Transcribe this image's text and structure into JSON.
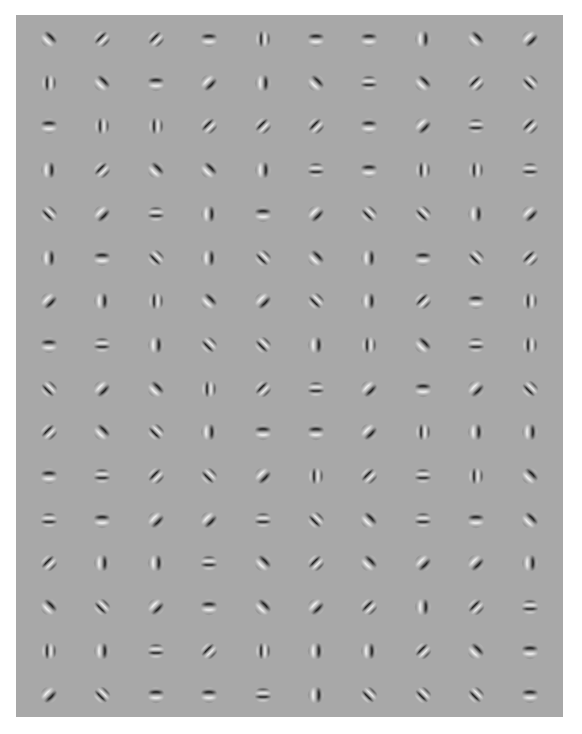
{
  "stimulus": {
    "description": "Grid of Gabor patches on gray background",
    "background_color": "#a8a8a8",
    "columns": 10,
    "rows": 16,
    "orientation_legend": {
      "=": 0,
      "|": 90,
      "/": 135,
      "\\": 45
    },
    "grid": [
      [
        "\\",
        "/",
        "/",
        "=",
        "|",
        "=",
        "=",
        "|",
        "\\",
        "/"
      ],
      [
        "|",
        "\\",
        "=",
        "/",
        "|",
        "\\",
        "=",
        "\\",
        "/",
        "\\"
      ],
      [
        "=",
        "|",
        "|",
        "/",
        "/",
        "/",
        "=",
        "/",
        "=",
        "/"
      ],
      [
        "|",
        "/",
        "\\",
        "\\",
        "|",
        "=",
        "=",
        "|",
        "|",
        "="
      ],
      [
        "\\",
        "/",
        "=",
        "|",
        "=",
        "/",
        "\\",
        "\\",
        "|",
        "/"
      ],
      [
        "|",
        "=",
        "\\",
        "|",
        "\\",
        "\\",
        "|",
        "=",
        "\\",
        "/"
      ],
      [
        "/",
        "|",
        "|",
        "\\",
        "/",
        "\\",
        "|",
        "/",
        "=",
        "|"
      ],
      [
        "=",
        "=",
        "|",
        "\\",
        "\\",
        "|",
        "|",
        "\\",
        "=",
        "|"
      ],
      [
        "\\",
        "/",
        "\\",
        "|",
        "/",
        "=",
        "/",
        "=",
        "/",
        "\\"
      ],
      [
        "/",
        "\\",
        "\\",
        "|",
        "=",
        "=",
        "/",
        "|",
        "|",
        "|"
      ],
      [
        "=",
        "=",
        "/",
        "\\",
        "/",
        "|",
        "/",
        "=",
        "|",
        "\\"
      ],
      [
        "=",
        "=",
        "/",
        "/",
        "=",
        "\\",
        "\\",
        "=",
        "=",
        "\\"
      ],
      [
        "/",
        "|",
        "|",
        "=",
        "\\",
        "/",
        "\\",
        "/",
        "/",
        "|"
      ],
      [
        "\\",
        "\\",
        "/",
        "=",
        "\\",
        "/",
        "/",
        "|",
        "/",
        "="
      ],
      [
        "|",
        "|",
        "=",
        "/",
        "|",
        "|",
        "|",
        "/",
        "\\",
        "="
      ],
      [
        "/",
        "\\",
        "=",
        "=",
        "=",
        "|",
        "\\",
        "\\",
        "\\",
        "="
      ]
    ],
    "frequency": [
      [
        "lo",
        "hi",
        "hi",
        "lo",
        "hi",
        "lo",
        "lo",
        "lo",
        "lo",
        "lo"
      ],
      [
        "hi",
        "lo",
        "lo",
        "lo",
        "lo",
        "lo",
        "hi",
        "lo",
        "hi",
        "hi"
      ],
      [
        "lo",
        "hi",
        "hi",
        "hi",
        "hi",
        "hi",
        "lo",
        "lo",
        "hi",
        "hi"
      ],
      [
        "lo",
        "hi",
        "lo",
        "lo",
        "lo",
        "hi",
        "lo",
        "hi",
        "hi",
        "hi"
      ],
      [
        "hi",
        "lo",
        "hi",
        "lo",
        "lo",
        "lo",
        "hi",
        "hi",
        "lo",
        "lo"
      ],
      [
        "lo",
        "lo",
        "hi",
        "lo",
        "hi",
        "lo",
        "lo",
        "lo",
        "hi",
        "hi"
      ],
      [
        "lo",
        "lo",
        "hi",
        "lo",
        "lo",
        "hi",
        "lo",
        "hi",
        "lo",
        "hi"
      ],
      [
        "lo",
        "hi",
        "lo",
        "hi",
        "hi",
        "lo",
        "hi",
        "lo",
        "hi",
        "hi"
      ],
      [
        "hi",
        "lo",
        "lo",
        "hi",
        "hi",
        "hi",
        "lo",
        "lo",
        "lo",
        "hi"
      ],
      [
        "hi",
        "lo",
        "hi",
        "lo",
        "lo",
        "lo",
        "lo",
        "hi",
        "lo",
        "lo"
      ],
      [
        "lo",
        "hi",
        "hi",
        "hi",
        "lo",
        "hi",
        "hi",
        "hi",
        "hi",
        "lo"
      ],
      [
        "hi",
        "lo",
        "lo",
        "lo",
        "hi",
        "hi",
        "lo",
        "hi",
        "lo",
        "lo"
      ],
      [
        "hi",
        "lo",
        "lo",
        "hi",
        "lo",
        "hi",
        "lo",
        "lo",
        "lo",
        "lo"
      ],
      [
        "lo",
        "hi",
        "lo",
        "lo",
        "lo",
        "lo",
        "hi",
        "lo",
        "hi",
        "hi"
      ],
      [
        "hi",
        "lo",
        "hi",
        "hi",
        "hi",
        "lo",
        "lo",
        "hi",
        "lo",
        "lo"
      ],
      [
        "lo",
        "hi",
        "lo",
        "lo",
        "hi",
        "lo",
        "hi",
        "hi",
        "hi",
        "lo"
      ]
    ]
  }
}
